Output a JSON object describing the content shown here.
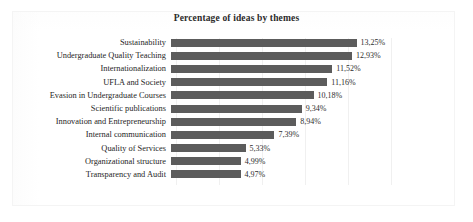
{
  "chart_data": {
    "type": "bar",
    "orientation": "horizontal",
    "title": "Percentage of ideas by themes",
    "xlabel": "",
    "ylabel": "",
    "grid": true,
    "legend": "none",
    "xlim": [
      0,
      14
    ],
    "categories": [
      "Sustainability",
      "Undergraduate Quality Teaching",
      "Internationalization",
      "UFLA and Society",
      "Evasion in Undergraduate Courses",
      "Scientific publications",
      "Innovation and Entrepreneurship",
      "Internal communication",
      "Quality of Services",
      "Organizational structure",
      "Transparency and Audit"
    ],
    "values": [
      13.25,
      12.93,
      11.52,
      11.16,
      10.18,
      9.34,
      8.94,
      7.39,
      5.33,
      4.99,
      4.97
    ],
    "value_labels": [
      "13,25%",
      "12,93%",
      "11,52%",
      "11,16%",
      "10,18%",
      "9,34%",
      "8,94%",
      "7,39%",
      "5,33%",
      "4,99%",
      "4,97%"
    ],
    "bar_color": "#5c5c5c",
    "background_color": "#ffffff",
    "text_color": "#262626"
  }
}
